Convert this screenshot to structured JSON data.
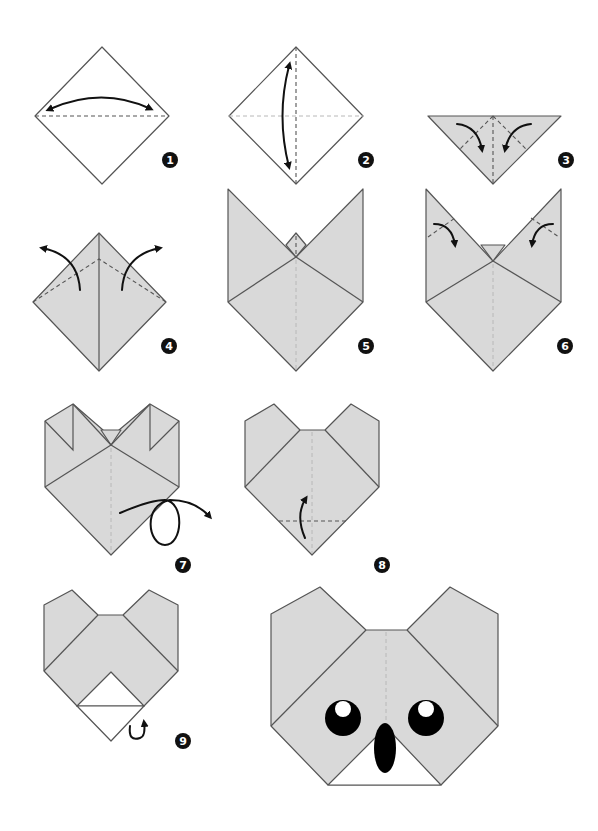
{
  "diagram": {
    "colors": {
      "paper_front": "#ffffff",
      "paper_back": "#d9d9d9",
      "outline": "#555555",
      "arrow": "#111111",
      "badge": "#111111",
      "eye": "#000000",
      "eye_highlight": "#ffffff"
    },
    "steps": [
      {
        "number": "1",
        "description": "Fold square diamond in half horizontally and unfold"
      },
      {
        "number": "2",
        "description": "Fold in half vertically and unfold"
      },
      {
        "number": "3",
        "description": "Fold top corners down to the bottom point"
      },
      {
        "number": "4",
        "description": "Fold flaps outward along dashed lines"
      },
      {
        "number": "5",
        "description": "Ears formed; small top flap folded down"
      },
      {
        "number": "6",
        "description": "Fold ear tips down"
      },
      {
        "number": "7",
        "description": "Turn the model over"
      },
      {
        "number": "8",
        "description": "Fold bottom point up"
      },
      {
        "number": "9",
        "description": "Fold the tip behind"
      }
    ],
    "final": {
      "label": "Finished koala face",
      "features": [
        "ears",
        "eyes",
        "nose"
      ]
    }
  }
}
